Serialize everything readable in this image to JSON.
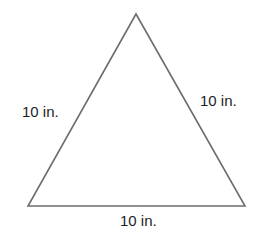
{
  "diagram": {
    "type": "equilateral-triangle",
    "vertices": {
      "apex": [
        136,
        14
      ],
      "bottom_left": [
        28,
        206
      ],
      "bottom_right": [
        245,
        206
      ]
    },
    "stroke_color": "#6e6e6e",
    "label_color": "#1e1e1e",
    "sides": [
      {
        "name": "left",
        "label": "10 in."
      },
      {
        "name": "right",
        "label": "10 in."
      },
      {
        "name": "bottom",
        "label": "10 in."
      }
    ]
  }
}
